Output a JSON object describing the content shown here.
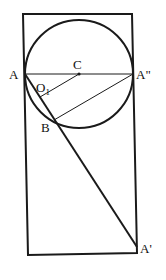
{
  "diagram": {
    "type": "geometry",
    "stroke_color": "#1a1a1a",
    "background": "#ffffff",
    "points": {
      "A": {
        "label": "A",
        "x": 25,
        "y": 74
      },
      "A2": {
        "label": "A\"",
        "x": 133,
        "y": 74
      },
      "C": {
        "label": "C",
        "x": 79,
        "y": 74
      },
      "O1": {
        "label": "O",
        "sub": "1",
        "x": 40,
        "y": 96
      },
      "B": {
        "label": "B",
        "x": 53,
        "y": 120
      },
      "A1": {
        "label": "A'",
        "x": 136,
        "y": 245
      }
    },
    "circle": {
      "center": "C",
      "radius": 54
    },
    "rectangle": {
      "corners": [
        [
          23,
          14
        ],
        [
          132,
          14
        ],
        [
          137,
          252
        ],
        [
          28,
          254
        ]
      ]
    },
    "segments": [
      [
        "A",
        "A2"
      ],
      [
        "A",
        "A1"
      ],
      [
        "C",
        "O1"
      ],
      [
        "A2",
        "B"
      ]
    ]
  }
}
